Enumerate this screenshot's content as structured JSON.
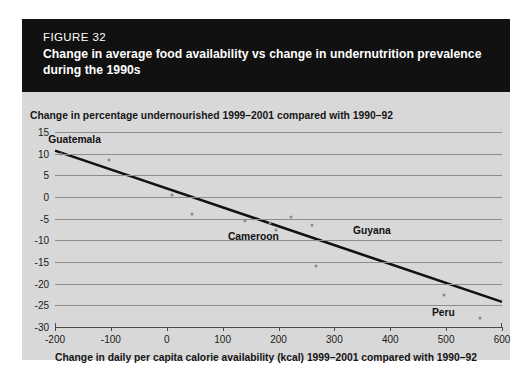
{
  "figure": {
    "number_label": "FIGURE 32",
    "title": "Change in average food availability vs change in undernutrition prevalence during the 1990s"
  },
  "colors": {
    "banner_bg": "#111111",
    "banner_text": "#ffffff",
    "panel_bg": "#d8d8d8",
    "gridline": "#8d8d8d",
    "axis": "#4a4a4a",
    "marker": "#8a8a8a",
    "trendline": "#111111",
    "page_bg": "#ffffff"
  },
  "chart_data": {
    "type": "scatter",
    "title": "Change in average food availability vs change in undernutrition prevalence during the 1990s",
    "subtitle": "",
    "ylabel": "Change in percentage undernourished 1999–2001 compared with 1990–92",
    "xlabel": "Change in daily per capita calorie availability (kcal) 1999–2001 compared with 1990–92",
    "xlim": [
      -200,
      600
    ],
    "ylim": [
      -30,
      15
    ],
    "xticks": [
      -200,
      -100,
      0,
      100,
      200,
      300,
      400,
      500,
      600
    ],
    "xtick_labels": [
      "-200",
      "-100",
      "0",
      "100",
      "200",
      "300",
      "400",
      "500",
      "600"
    ],
    "yticks": [
      15,
      10,
      5,
      0,
      -5,
      -10,
      -15,
      -20,
      -25,
      -30
    ],
    "ytick_labels": [
      "15",
      "10",
      "5",
      "0",
      "-5",
      "-10",
      "-15",
      "-20",
      "-25",
      "-30"
    ],
    "grid": "horizontal",
    "legend": "none",
    "points": [
      {
        "x": -190,
        "y": 10,
        "label": "Guatemala"
      },
      {
        "x": -103,
        "y": 8.5,
        "label": ""
      },
      {
        "x": 10,
        "y": 0.5,
        "label": ""
      },
      {
        "x": 45,
        "y": -4,
        "label": ""
      },
      {
        "x": 140,
        "y": -5.5,
        "label": "Cameroon"
      },
      {
        "x": 185,
        "y": -6,
        "label": ""
      },
      {
        "x": 195,
        "y": -7.5,
        "label": ""
      },
      {
        "x": 222,
        "y": -4.5,
        "label": ""
      },
      {
        "x": 260,
        "y": -6.5,
        "label": ""
      },
      {
        "x": 268,
        "y": -16,
        "label": ""
      },
      {
        "x": 340,
        "y": -7,
        "label": "Guyana"
      },
      {
        "x": 497,
        "y": -22.5,
        "label": ""
      },
      {
        "x": 560,
        "y": -28,
        "label": "Peru"
      }
    ],
    "annotations": [
      {
        "text": "Guatemala",
        "x": -165,
        "y": 13.5
      },
      {
        "text": "Cameroon",
        "x": 155,
        "y": -9.0
      },
      {
        "text": "Guyana",
        "x": 367,
        "y": -7.5
      },
      {
        "text": "Peru",
        "x": 495,
        "y": -26.5
      }
    ],
    "trendline": {
      "type": "linear",
      "x_start": -200,
      "y_start": 10.7,
      "x_end": 600,
      "y_end": -24.2
    }
  }
}
